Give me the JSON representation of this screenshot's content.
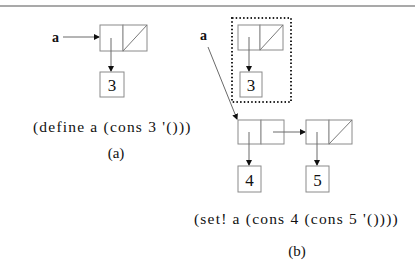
{
  "figure": {
    "panel_a": {
      "variable_label": "a",
      "car_value": "3",
      "code": "(define a (cons 3 '()))",
      "caption": "(a)"
    },
    "panel_b": {
      "variable_label": "a",
      "old_car_value": "3",
      "new_car_values": [
        "4",
        "5"
      ],
      "code": "(set! a (cons 4 (cons 5 '())))",
      "caption": "(b)"
    }
  }
}
